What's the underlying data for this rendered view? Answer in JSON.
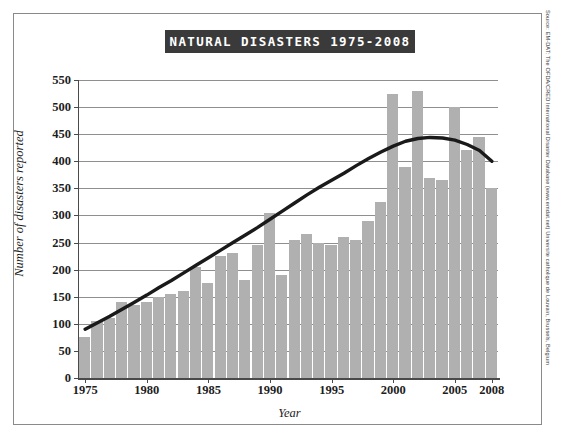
{
  "title": "NATURAL DISASTERS 1975-2008",
  "source_note": "Source: EM-DAT: The OFDA/CRED International Disaster Database (www.emdat.net) Universite catholique de Louvain, Brussels, Belgium",
  "colors": {
    "bar": "#b0b0b0",
    "trend_line": "#1a1a1a",
    "gridline": "#8f8f8f",
    "axis": "#4a4a4a",
    "title_banner": "#3a3a3a",
    "title_text": "#ffffff",
    "frame_border": "#8a8a8a",
    "background": "#ffffff"
  },
  "chart_data": {
    "type": "bar",
    "title": "NATURAL DISASTERS 1975-2008",
    "xlabel": "Year",
    "ylabel": "Number of disasters reported",
    "ylim": [
      0,
      550
    ],
    "ytick_values": [
      0,
      50,
      100,
      150,
      200,
      250,
      300,
      350,
      400,
      450,
      500,
      550
    ],
    "ytick_labels": [
      "0",
      "50",
      "100",
      "150",
      "200",
      "250",
      "300",
      "350",
      "400",
      "450",
      "500",
      "550"
    ],
    "xtick_labels": [
      "1975",
      "1980",
      "1985",
      "1990",
      "1995",
      "2000",
      "2005",
      "2008"
    ],
    "xtick_years": [
      1975,
      1980,
      1985,
      1990,
      1995,
      2000,
      2005,
      2008
    ],
    "grid": true,
    "legend": "none",
    "categories": [
      1975,
      1976,
      1977,
      1978,
      1979,
      1980,
      1981,
      1982,
      1983,
      1984,
      1985,
      1986,
      1987,
      1988,
      1989,
      1990,
      1991,
      1992,
      1993,
      1994,
      1995,
      1996,
      1997,
      1998,
      1999,
      2000,
      2001,
      2002,
      2003,
      2004,
      2005,
      2006,
      2007,
      2008
    ],
    "values": [
      75,
      105,
      110,
      140,
      135,
      140,
      150,
      155,
      160,
      205,
      175,
      225,
      230,
      180,
      245,
      305,
      190,
      255,
      265,
      250,
      245,
      260,
      255,
      290,
      325,
      525,
      390,
      530,
      370,
      365,
      500,
      420,
      445,
      350
    ],
    "series": [
      {
        "name": "Disasters reported",
        "type": "bar",
        "values": [
          75,
          105,
          110,
          140,
          135,
          140,
          150,
          155,
          160,
          205,
          175,
          225,
          230,
          180,
          245,
          305,
          190,
          255,
          265,
          250,
          245,
          260,
          255,
          290,
          325,
          525,
          390,
          530,
          370,
          365,
          500,
          420,
          445,
          350
        ]
      },
      {
        "name": "Trend",
        "type": "line",
        "values": [
          90,
          102,
          114,
          127,
          140,
          153,
          167,
          180,
          194,
          208,
          222,
          236,
          250,
          264,
          278,
          293,
          308,
          323,
          338,
          352,
          365,
          378,
          392,
          405,
          417,
          428,
          437,
          442,
          444,
          443,
          439,
          431,
          420,
          400
        ]
      }
    ]
  }
}
